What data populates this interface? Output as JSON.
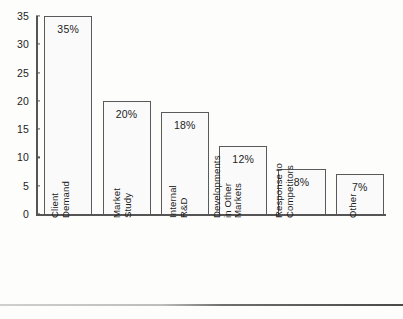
{
  "chart_data": {
    "type": "bar",
    "title": "",
    "subtitle": "",
    "xlabel": "",
    "ylabel": "",
    "ylim": [
      0,
      35
    ],
    "yticks": [
      0,
      5,
      10,
      15,
      20,
      25,
      30,
      35
    ],
    "ytick_labels": [
      "0",
      "5",
      "10",
      "15",
      "20",
      "25",
      "30",
      "35"
    ],
    "grid": false,
    "legend": false,
    "orientation": "vertical",
    "categories": [
      "Client Demand",
      "Market Study",
      "Internal R&D",
      "Developments in Other Markets",
      "Response to Competitors",
      "Other"
    ],
    "category_lines": [
      [
        "Client",
        "Demand"
      ],
      [
        "Market",
        "Study"
      ],
      [
        "Internal",
        "R&D"
      ],
      [
        "Developments",
        "in Other",
        "Markets"
      ],
      [
        "Response to",
        "Competitors"
      ],
      [
        "Other"
      ]
    ],
    "values": [
      35,
      20,
      18,
      12,
      8,
      7
    ],
    "data_labels": [
      "35%",
      "20%",
      "18%",
      "12%",
      "8%",
      "7%"
    ],
    "colors": {
      "bar_fill": "#fafafa",
      "bar_border": "#5a5a5a",
      "axis": "#555555",
      "text": "#1d1d1d",
      "background": "#fdfdfc"
    }
  }
}
